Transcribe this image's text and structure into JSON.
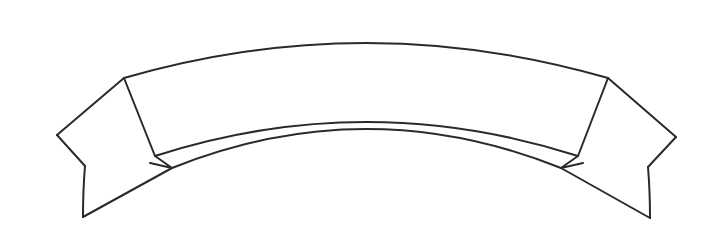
{
  "document": {
    "title": "Blank Ribbon Banner Outline",
    "type": "line-art-illustration",
    "background_color": "#ffffff",
    "stroke_color": "#2a2a2a",
    "fill_color": "#ffffff",
    "stroke_width": 2,
    "width": 722,
    "height": 252
  },
  "figure": {
    "name": "ribbon-banner",
    "style": "black outline on white, no fill, empty interior",
    "banner_text": "",
    "parts": [
      {
        "id": "center-panel",
        "label": "Center Banner Panel",
        "text": ""
      },
      {
        "id": "left-tail",
        "label": "Left Streamer Tail",
        "text": ""
      },
      {
        "id": "right-tail",
        "label": "Right Streamer Tail",
        "text": ""
      },
      {
        "id": "left-fold",
        "label": "Left Fold Notch",
        "text": ""
      },
      {
        "id": "right-fold",
        "label": "Right Fold Notch",
        "text": ""
      }
    ]
  },
  "geometry": {
    "center_panel": {
      "top_left": [
        124,
        78
      ],
      "top_right": [
        608,
        78
      ],
      "bottom_left": [
        155,
        156
      ],
      "bottom_right": [
        578,
        156
      ],
      "top_arc_apex": [
        366,
        30
      ],
      "bottom_arc_apex": [
        366,
        110
      ]
    },
    "left_tail": {
      "upper_outer": [
        57,
        135
      ],
      "notch": [
        85,
        166
      ],
      "bottom_tip": [
        83,
        217
      ],
      "fold_point": [
        172,
        168
      ]
    },
    "right_tail": {
      "upper_outer": [
        676,
        137
      ],
      "notch": [
        648,
        167
      ],
      "bottom_tip": [
        650,
        218
      ],
      "fold_point": [
        561,
        168
      ]
    }
  }
}
